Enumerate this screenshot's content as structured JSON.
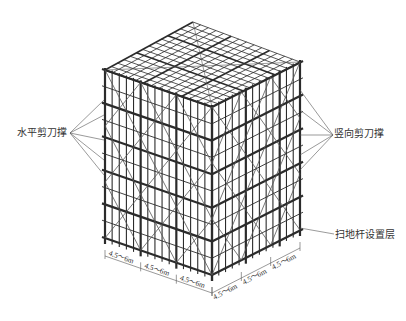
{
  "diagram": {
    "labels": {
      "horizontal_brace": "水平剪刀撑",
      "vertical_brace": "竖向剪刀撑",
      "sweep_rod_layer": "扫地杆设置层"
    },
    "dimensions": {
      "left_edge": [
        "4.5～6m",
        "4.5～6m",
        "4.5～6m"
      ],
      "right_edge": [
        "4.5～6m",
        "4.5～6m",
        "4.5～6m"
      ]
    },
    "colors": {
      "line": "#2b2b2b",
      "thin": "#555555",
      "background": "#ffffff"
    }
  }
}
